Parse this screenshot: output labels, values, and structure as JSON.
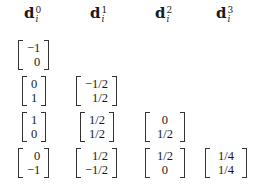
{
  "headers": [
    {
      "base": "d",
      "sup": "0",
      "sub": "i"
    },
    {
      "base": "d",
      "sup": "1",
      "sub": "i"
    },
    {
      "base": "d",
      "sup": "2",
      "sub": "i"
    },
    {
      "base": "d",
      "sup": "3",
      "sub": "i"
    }
  ],
  "rows": [
    [
      {
        "top": "−1",
        "bottom": "0"
      }
    ],
    [
      {
        "top": "0",
        "bottom": "1"
      },
      {
        "top": "−1/2",
        "bottom": "1/2"
      }
    ],
    [
      {
        "top": "1",
        "bottom": "0"
      },
      {
        "top": "1/2",
        "bottom": "1/2"
      },
      {
        "top": "0",
        "bottom": "1/2"
      }
    ],
    [
      {
        "top": "0",
        "bottom": "−1"
      },
      {
        "top": "1/2",
        "bottom": "−1/2"
      },
      {
        "top": "1/2",
        "bottom": "0"
      },
      {
        "top": "1/4",
        "bottom": "1/4"
      }
    ]
  ]
}
